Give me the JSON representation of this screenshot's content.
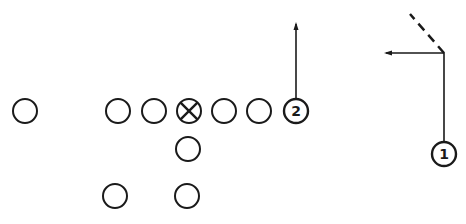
{
  "diagram": {
    "type": "football-play",
    "stroke_color": "#1a1a1a",
    "background": "#ffffff",
    "players": [
      {
        "id": "split-end-left",
        "x": 25,
        "y": 111,
        "label": ""
      },
      {
        "id": "lineman-1",
        "x": 118,
        "y": 111,
        "label": ""
      },
      {
        "id": "lineman-2",
        "x": 154,
        "y": 111,
        "label": ""
      },
      {
        "id": "center",
        "x": 189,
        "y": 111,
        "label": "",
        "marker": "x"
      },
      {
        "id": "lineman-4",
        "x": 224,
        "y": 111,
        "label": ""
      },
      {
        "id": "lineman-5",
        "x": 259,
        "y": 111,
        "label": ""
      },
      {
        "id": "receiver-2",
        "x": 296,
        "y": 111,
        "label": "2"
      },
      {
        "id": "quarterback",
        "x": 188,
        "y": 149,
        "label": ""
      },
      {
        "id": "back-left",
        "x": 115,
        "y": 196,
        "label": ""
      },
      {
        "id": "back-right",
        "x": 187,
        "y": 196,
        "label": ""
      },
      {
        "id": "receiver-1",
        "x": 444,
        "y": 154,
        "label": "1"
      }
    ],
    "routes": [
      {
        "id": "route-receiver-2",
        "points": [
          [
            296,
            99
          ],
          [
            296,
            24
          ]
        ],
        "arrow": true,
        "dashed": false
      },
      {
        "id": "route-receiver-1",
        "points": [
          [
            444,
            142
          ],
          [
            444,
            53
          ],
          [
            386,
            53
          ]
        ],
        "arrow": true,
        "dashed": false
      },
      {
        "id": "route-receiver-1-option",
        "points": [
          [
            444,
            53
          ],
          [
            410,
            14
          ]
        ],
        "arrow": false,
        "dashed": true
      }
    ]
  }
}
